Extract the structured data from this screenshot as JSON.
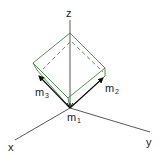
{
  "diagram": {
    "title": "",
    "axes": {
      "z_label": "z",
      "x_label": "x",
      "y_label": "y"
    },
    "vectors": {
      "m1": {
        "base": "m",
        "sub": "1"
      },
      "m2": {
        "base": "m",
        "sub": "2"
      },
      "m3": {
        "base": "m",
        "sub": "3"
      }
    },
    "colors": {
      "axis": "#444444",
      "cube": "#3a8a3a",
      "vector": "#111111",
      "text": "#1a1a1a"
    }
  }
}
